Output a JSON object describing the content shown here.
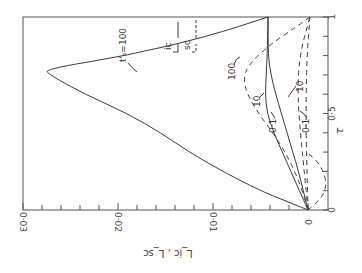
{
  "chart_data": {
    "type": "line",
    "orientation": "rotated-90",
    "title": "",
    "xlabel": "τ",
    "ylabel": "L_ic , L_sc",
    "xlim": [
      0,
      1
    ],
    "ylim": [
      0,
      0.03
    ],
    "x_ticks": [
      "0",
      "0·5",
      "1"
    ],
    "y_ticks": [
      "0",
      "0·01",
      "0·02",
      "0·03"
    ],
    "legend": [
      {
        "label": "ic",
        "style": "solid"
      },
      {
        "label": "sc",
        "style": "dashed"
      }
    ],
    "annotations": [
      "t'ₛ=100",
      "100",
      "10",
      "10",
      "0·1",
      "0·1"
    ],
    "series": [
      {
        "name": "L_ic, t's=100",
        "style": "solid",
        "x": [
          0,
          0.05,
          0.1,
          0.2,
          0.3,
          0.4,
          0.5,
          0.6,
          0.7,
          0.73,
          0.8,
          0.9,
          1.0
        ],
        "values": [
          0,
          0.0025,
          0.005,
          0.009,
          0.0125,
          0.0155,
          0.019,
          0.0235,
          0.0272,
          0.0277,
          0.019,
          0.0105,
          0.0042
        ]
      },
      {
        "name": "L_ic, t's=10",
        "style": "solid",
        "x": [
          0,
          0.1,
          0.2,
          0.3,
          0.4,
          0.5,
          0.6,
          0.7,
          0.8,
          1.0
        ],
        "values": [
          0,
          0.0009,
          0.0018,
          0.0027,
          0.0036,
          0.0043,
          0.0045,
          0.0044,
          0.0043,
          0.0042
        ]
      },
      {
        "name": "L_ic, t's=0.1",
        "style": "solid",
        "x": [
          0,
          0.1,
          0.2,
          0.3,
          0.4,
          0.5,
          0.6,
          0.7,
          0.8,
          1.0
        ],
        "values": [
          0,
          0.0005,
          0.001,
          0.0016,
          0.0022,
          0.0028,
          0.0034,
          0.0039,
          0.0042,
          0.0042
        ]
      },
      {
        "name": "L_sc, t's=100",
        "style": "dashed",
        "x": [
          0,
          0.1,
          0.2,
          0.3,
          0.4,
          0.5,
          0.6,
          0.68,
          0.75,
          0.85,
          0.95,
          1.0
        ],
        "values": [
          0,
          0.0006,
          0.0014,
          0.0024,
          0.0037,
          0.0052,
          0.0064,
          0.0068,
          0.0063,
          0.0042,
          0.0012,
          -0.0002
        ]
      },
      {
        "name": "L_sc, t's=10",
        "style": "dashed",
        "x": [
          0,
          0.2,
          0.4,
          0.6,
          0.8,
          1.0
        ],
        "values": [
          0,
          0.0004,
          0.0008,
          0.0011,
          0.0009,
          -0.0002
        ]
      },
      {
        "name": "L_sc, t's=0.1",
        "style": "dashed",
        "x": [
          0,
          0.2,
          0.4,
          0.6,
          0.8,
          1.0
        ],
        "values": [
          0,
          0.0001,
          0.0002,
          0.0002,
          0.0001,
          -0.0002
        ]
      },
      {
        "name": "L_sc, loop",
        "style": "dashed",
        "x": [
          0,
          0.05,
          0.1,
          0.15,
          0.2,
          0.25,
          0.3
        ],
        "values": [
          0,
          -0.0012,
          -0.0018,
          -0.0019,
          -0.0016,
          -0.001,
          0.0001
        ]
      }
    ]
  },
  "axes": {
    "tau_label": "τ",
    "tau_ticks": [
      {
        "label": "0",
        "v": 0
      },
      {
        "label": "0·5",
        "v": 0.5
      },
      {
        "label": "1",
        "v": 1
      }
    ],
    "value_ticks": [
      {
        "label": "0",
        "v": 0
      },
      {
        "label": "0·01",
        "v": 0.01
      },
      {
        "label": "0·02",
        "v": 0.02
      },
      {
        "label": "0·03",
        "v": 0.03
      }
    ],
    "value_label": "L_ic , L_sc"
  },
  "labels": {
    "t100": "t'ₛ=100",
    "legend_ic": "ic",
    "legend_sc": "sc",
    "d100": "100",
    "s10": "10",
    "d10": "10",
    "s01": "0·1",
    "d01": "0·1"
  }
}
